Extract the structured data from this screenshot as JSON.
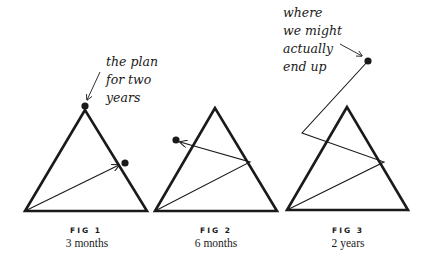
{
  "figures": [
    {
      "label": "FIG 1",
      "caption": "3 months",
      "annotation": [
        "the plan",
        "for two",
        "years"
      ]
    },
    {
      "label": "FIG 2",
      "caption": "6 months"
    },
    {
      "label": "FIG 3",
      "caption": "2 years",
      "annotation": [
        "where",
        "we might",
        "actually",
        "end up"
      ]
    }
  ],
  "colors": {
    "ink": "#1a1a1a",
    "background": "#ffffff"
  }
}
